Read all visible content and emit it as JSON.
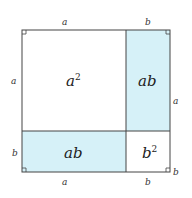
{
  "diagram": {
    "fill_color": "#d6f1f8",
    "line_color": "#333333",
    "regions": [
      {
        "id": "a-squared",
        "label": "a",
        "sup": "2",
        "filled": false
      },
      {
        "id": "ab-top-right",
        "label": "ab",
        "filled": true
      },
      {
        "id": "ab-bottom-left",
        "label": "ab",
        "filled": true
      },
      {
        "id": "b-squared",
        "label": "b",
        "sup": "2",
        "filled": false
      }
    ],
    "side_labels": {
      "top_a": "a",
      "top_b": "b",
      "left_a": "a",
      "left_b": "b",
      "right_a": "a",
      "right_b": "b",
      "bottom_a": "a",
      "bottom_b": "b"
    }
  }
}
